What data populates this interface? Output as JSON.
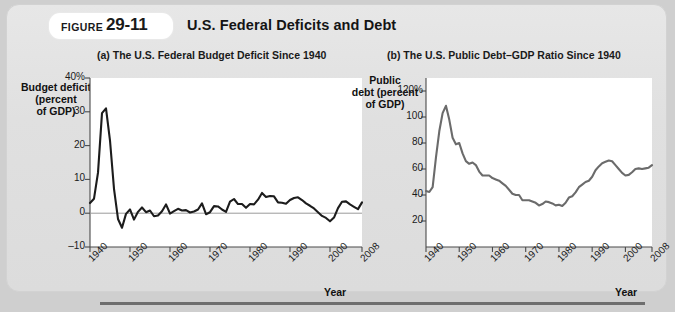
{
  "figure": {
    "label": "FIGURE",
    "number": "29-11",
    "title": "U.S. Federal Deficits and Debt"
  },
  "panel_a": {
    "title": "(a) The U.S. Federal Budget Deficit Since 1940",
    "y_axis_title": "Budget deficit\n(percent\nof GDP)",
    "x_axis_title": "Year",
    "y_ticks": [
      "40%",
      "30",
      "20",
      "10",
      "0",
      "–10"
    ],
    "x_ticks": [
      "1940",
      "1950",
      "1960",
      "1970",
      "1980",
      "1990",
      "2000",
      "2008"
    ]
  },
  "panel_b": {
    "title": "(b) The U.S. Public Debt–GDP Ratio Since 1940",
    "y_axis_title": "Public\ndebt (percent\nof GDP)",
    "x_axis_title": "Year",
    "y_ticks": [
      "120%",
      "100",
      "80",
      "60",
      "40",
      "20"
    ],
    "x_ticks": [
      "1940",
      "1950",
      "1960",
      "1970",
      "1980",
      "1990",
      "2000",
      "2008"
    ]
  },
  "colors": {
    "card_background": "#e3e3e3",
    "plot_background": "#ffffff",
    "deficit_line": "#1c1c1c",
    "debt_line": "#6b6b6b",
    "axis": "#4a4a4a",
    "zero_line": "#9a9a9a",
    "bottom_rule": "#6e6e6e"
  },
  "chart_data": [
    {
      "type": "line",
      "id": "panel-a-deficit",
      "title": "(a) The U.S. Federal Budget Deficit Since 1940",
      "xlabel": "Year",
      "ylabel": "Budget deficit (percent of GDP)",
      "xlim": [
        1940,
        2008
      ],
      "ylim": [
        -10,
        40
      ],
      "grid": false,
      "legend": "none",
      "series": [
        {
          "name": "Federal budget deficit (% of GDP)",
          "x": [
            1940,
            1941,
            1942,
            1943,
            1944,
            1945,
            1946,
            1947,
            1948,
            1949,
            1950,
            1951,
            1952,
            1953,
            1954,
            1955,
            1956,
            1957,
            1958,
            1959,
            1960,
            1961,
            1962,
            1963,
            1964,
            1965,
            1966,
            1967,
            1968,
            1969,
            1970,
            1971,
            1972,
            1973,
            1974,
            1975,
            1976,
            1977,
            1978,
            1979,
            1980,
            1981,
            1982,
            1983,
            1984,
            1985,
            1986,
            1987,
            1988,
            1989,
            1990,
            1991,
            1992,
            1993,
            1994,
            1995,
            1996,
            1997,
            1998,
            1999,
            2000,
            2001,
            2002,
            2003,
            2004,
            2005,
            2006,
            2007,
            2008
          ],
          "y": [
            3.0,
            4.3,
            12.0,
            29.6,
            31.0,
            21.5,
            7.2,
            -1.7,
            -4.3,
            -0.2,
            1.1,
            -1.9,
            0.4,
            1.7,
            0.3,
            0.8,
            -0.9,
            -0.7,
            0.6,
            2.6,
            -0.1,
            0.6,
            1.3,
            0.8,
            0.9,
            0.2,
            0.5,
            1.1,
            2.9,
            -0.3,
            0.3,
            2.1,
            2.0,
            1.1,
            0.4,
            3.4,
            4.2,
            2.7,
            2.7,
            1.6,
            2.7,
            2.6,
            4.0,
            6.0,
            4.8,
            5.1,
            5.0,
            3.2,
            3.1,
            2.8,
            3.9,
            4.5,
            4.7,
            3.9,
            2.9,
            2.2,
            1.4,
            0.3,
            -0.8,
            -1.4,
            -2.4,
            -1.3,
            1.5,
            3.4,
            3.5,
            2.6,
            1.9,
            1.2,
            3.2
          ]
        }
      ]
    },
    {
      "type": "line",
      "id": "panel-b-debt",
      "title": "(b) The U.S. Public Debt–GDP Ratio Since 1940",
      "xlabel": "Year",
      "ylabel": "Public debt (percent of GDP)",
      "xlim": [
        1940,
        2008
      ],
      "ylim": [
        0,
        120
      ],
      "grid": false,
      "legend": "none",
      "series": [
        {
          "name": "Public debt as percent of GDP",
          "x": [
            1940,
            1941,
            1942,
            1943,
            1944,
            1945,
            1946,
            1947,
            1948,
            1949,
            1950,
            1951,
            1952,
            1953,
            1954,
            1955,
            1956,
            1957,
            1958,
            1959,
            1960,
            1961,
            1962,
            1963,
            1964,
            1965,
            1966,
            1967,
            1968,
            1969,
            1970,
            1971,
            1972,
            1973,
            1974,
            1975,
            1976,
            1977,
            1978,
            1979,
            1980,
            1981,
            1982,
            1983,
            1984,
            1985,
            1986,
            1987,
            1988,
            1989,
            1990,
            1991,
            1992,
            1993,
            1994,
            1995,
            1996,
            1997,
            1998,
            1999,
            2000,
            2001,
            2002,
            2003,
            2004,
            2005,
            2006,
            2007,
            2008
          ],
          "y": [
            43.0,
            42.3,
            46.0,
            69.0,
            89.0,
            103.0,
            108.6,
            98.0,
            84.0,
            79.0,
            80.0,
            72.0,
            66.0,
            64.0,
            65.0,
            63.0,
            58.0,
            55.0,
            55.0,
            55.0,
            53.0,
            52.0,
            51.0,
            49.0,
            47.0,
            44.0,
            41.0,
            40.0,
            40.0,
            36.0,
            36.0,
            36.0,
            35.0,
            34.0,
            32.0,
            33.0,
            35.0,
            34.5,
            33.5,
            32.0,
            32.5,
            31.5,
            34.0,
            38.0,
            39.0,
            42.0,
            46.0,
            48.0,
            50.0,
            51.0,
            54.0,
            59.0,
            62.0,
            64.5,
            65.5,
            66.5,
            66.0,
            63.0,
            60.0,
            57.0,
            55.0,
            55.5,
            57.5,
            60.0,
            60.5,
            60.0,
            60.5,
            61.0,
            63.0
          ]
        }
      ]
    }
  ]
}
